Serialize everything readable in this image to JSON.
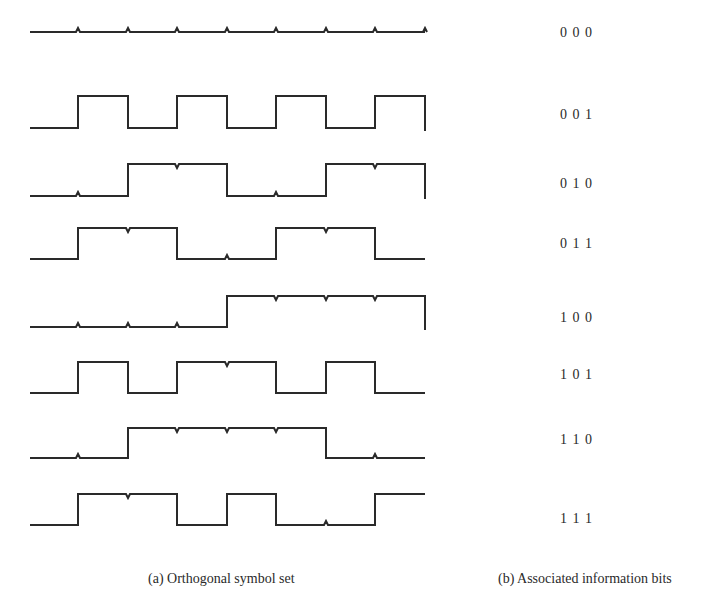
{
  "figure": {
    "caption_a": "(a) Orthogonal symbol set",
    "caption_b": "(b) Associated information bits",
    "stroke_color": "#2a2a2a",
    "chip_boundaries_x": [
      30,
      78,
      128,
      177,
      227,
      276,
      326,
      375,
      425
    ],
    "rows": [
      {
        "bits": "0 0 0",
        "chips": [
          0,
          0,
          0,
          0,
          0,
          0,
          0,
          0
        ],
        "low_y": 32,
        "high_y": 32,
        "label_y": 25
      },
      {
        "bits": "0 0 1",
        "chips": [
          0,
          1,
          0,
          1,
          0,
          1,
          0,
          1
        ],
        "low_y": 128,
        "high_y": 96,
        "label_y": 107
      },
      {
        "bits": "0 1 0",
        "chips": [
          0,
          0,
          1,
          1,
          0,
          0,
          1,
          1
        ],
        "low_y": 196,
        "high_y": 164,
        "label_y": 176
      },
      {
        "bits": "0 1 1",
        "chips": [
          0,
          1,
          1,
          0,
          0,
          1,
          1,
          0
        ],
        "low_y": 259,
        "high_y": 228,
        "label_y": 236
      },
      {
        "bits": "1 0 0",
        "chips": [
          0,
          0,
          0,
          0,
          1,
          1,
          1,
          1
        ],
        "low_y": 327,
        "high_y": 296,
        "label_y": 310
      },
      {
        "bits": "1 0 1",
        "chips": [
          0,
          1,
          0,
          1,
          1,
          0,
          1,
          0
        ],
        "low_y": 393,
        "high_y": 362,
        "label_y": 367
      },
      {
        "bits": "1 1 0",
        "chips": [
          0,
          0,
          1,
          1,
          1,
          1,
          0,
          0
        ],
        "low_y": 458,
        "high_y": 428,
        "label_y": 432
      },
      {
        "bits": "1 1 1",
        "chips": [
          0,
          1,
          1,
          0,
          1,
          0,
          0,
          1
        ],
        "low_y": 525,
        "high_y": 494,
        "label_y": 511
      }
    ]
  }
}
